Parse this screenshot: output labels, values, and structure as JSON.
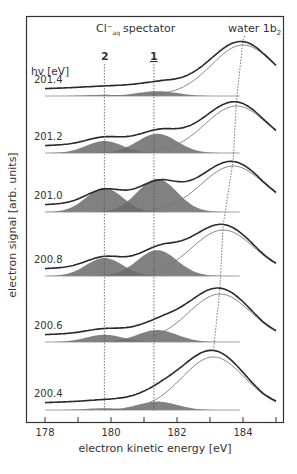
{
  "chart_data": {
    "type": "line",
    "title": "",
    "xlabel": "electron kinetic energy [eV]",
    "ylabel": "electron signal [arb. units]",
    "xlim": [
      177.6,
      185.2
    ],
    "x_ticks": [
      178,
      179,
      180,
      181,
      182,
      183,
      184,
      185
    ],
    "x_tick_labels": [
      "178",
      "180",
      "182",
      "184"
    ],
    "grid": false,
    "legend": null,
    "annotations": {
      "spectator_label": "Cl⁻",
      "spectator_sub": "aq",
      "spectator_text": "spectator",
      "water_label": "water 1b",
      "water_sub": "2",
      "peak2_label": "2",
      "peak1_label": "1",
      "hv_label": "hv [eV]"
    },
    "reference_lines": [
      {
        "name": "peak 2",
        "energy": 179.8,
        "style": "dotted vertical"
      },
      {
        "name": "peak 1",
        "energy": 181.3,
        "style": "dotted vertical"
      },
      {
        "name": "water 1b2 dispersion",
        "style": "dotted slanted",
        "points": [
          [
            184.0,
            201.4
          ],
          [
            183.8,
            201.2
          ],
          [
            183.7,
            201.0
          ],
          [
            183.4,
            200.8
          ],
          [
            183.3,
            200.6
          ],
          [
            183.1,
            200.4
          ]
        ]
      }
    ],
    "series": [
      {
        "name": "201.4",
        "hv": 201.4,
        "water_peak_eV": 184.0,
        "peak2_amp": 0.02,
        "peak1_amp": 0.08,
        "baseline_y": 96,
        "water_top_y": 40
      },
      {
        "name": "201.2",
        "hv": 201.2,
        "water_peak_eV": 183.8,
        "peak2_amp": 0.2,
        "peak1_amp": 0.32,
        "baseline_y": 153,
        "water_top_y": 101
      },
      {
        "name": "201.0",
        "hv": 201.0,
        "water_peak_eV": 183.7,
        "peak2_amp": 0.4,
        "peak1_amp": 0.55,
        "baseline_y": 212,
        "water_top_y": 161
      },
      {
        "name": "200.8",
        "hv": 200.8,
        "water_peak_eV": 183.4,
        "peak2_amp": 0.3,
        "peak1_amp": 0.43,
        "baseline_y": 276,
        "water_top_y": 225
      },
      {
        "name": "200.6",
        "hv": 200.6,
        "water_peak_eV": 183.3,
        "peak2_amp": 0.12,
        "peak1_amp": 0.2,
        "baseline_y": 342,
        "water_top_y": 289
      },
      {
        "name": "200.4",
        "hv": 200.4,
        "water_peak_eV": 183.1,
        "peak2_amp": 0.03,
        "peak1_amp": 0.14,
        "baseline_y": 410,
        "water_top_y": 352
      }
    ],
    "colors": {
      "frame": "#333333",
      "data": "#2a2a2a",
      "fit": "#777777",
      "fill": "#6b6b6b",
      "dotted": "#555555"
    }
  }
}
